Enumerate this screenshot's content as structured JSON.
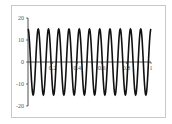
{
  "chart_data": {
    "type": "line",
    "title": "",
    "xlabel": "",
    "ylabel": "",
    "xlim": [
      0,
      1
    ],
    "ylim": [
      -20,
      20
    ],
    "grid": false,
    "legend": null,
    "x_ticks": [
      "0.2",
      "0.4",
      "0.6",
      "0.8",
      "1"
    ],
    "y_ticks": [
      "20",
      "10",
      "0",
      "-10",
      "-20"
    ],
    "series": [
      {
        "name": "signal",
        "function": "15*cos(2*pi*12*x)",
        "amplitude": 15,
        "cycles": 12,
        "color": "#111111",
        "x": [
          0,
          0.0417,
          0.0833,
          0.125,
          0.1667,
          0.2083,
          0.25,
          0.2917,
          0.3333,
          0.375,
          0.4167,
          0.4583,
          0.5,
          0.5417,
          0.5833,
          0.625,
          0.6667,
          0.7083,
          0.75,
          0.7917,
          0.8333,
          0.875,
          0.9167,
          0.9583,
          1
        ],
        "values": [
          15,
          -15,
          15,
          -15,
          15,
          -15,
          15,
          -15,
          15,
          -15,
          15,
          -15,
          15,
          -15,
          15,
          -15,
          15,
          -15,
          15,
          -15,
          15,
          -15,
          15,
          -15,
          15
        ]
      }
    ]
  },
  "axis": {
    "x_labels": [
      "0.2",
      "0.4",
      "0.6",
      "0.8",
      "1"
    ],
    "y_labels": [
      "20",
      "10",
      "0",
      "-10",
      "-20"
    ]
  }
}
